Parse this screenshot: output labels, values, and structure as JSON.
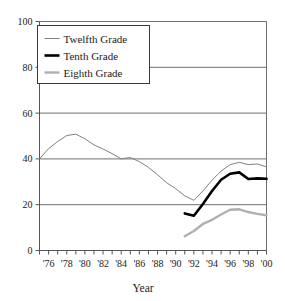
{
  "chart_data": {
    "type": "line",
    "title": "",
    "xlabel": "Year",
    "ylabel": "",
    "xlim": [
      1975,
      2000
    ],
    "ylim": [
      0,
      100
    ],
    "yticks": [
      0,
      20,
      40,
      60,
      80,
      100
    ],
    "ytick_labels": [
      "0",
      "20",
      "40",
      "60",
      "80",
      "100"
    ],
    "xticks": [
      1975,
      1976,
      1977,
      1978,
      1979,
      1980,
      1981,
      1982,
      1983,
      1984,
      1985,
      1986,
      1987,
      1988,
      1989,
      1990,
      1991,
      1992,
      1993,
      1994,
      1995,
      1996,
      1997,
      1998,
      1999,
      2000
    ],
    "xtick_labels": [
      "'76",
      "'78",
      "'80",
      "'82",
      "'84",
      "'86",
      "'88",
      "'90",
      "'92",
      "'94",
      "'96",
      "'98",
      "'00"
    ],
    "xtick_label_years": [
      1976,
      1978,
      1980,
      1982,
      1984,
      1986,
      1988,
      1990,
      1992,
      1994,
      1996,
      1998,
      2000
    ],
    "grid": "horizontal",
    "legend_position": "upper-left",
    "series": [
      {
        "name": "Twelfth Grade",
        "color": "#808080",
        "width": 1,
        "x": [
          1975,
          1976,
          1977,
          1978,
          1979,
          1980,
          1981,
          1982,
          1983,
          1984,
          1985,
          1986,
          1987,
          1988,
          1989,
          1990,
          1991,
          1992,
          1993,
          1994,
          1995,
          1996,
          1997,
          1998,
          1999,
          2000
        ],
        "values": [
          40.0,
          44.5,
          47.6,
          50.2,
          50.8,
          48.8,
          46.1,
          44.3,
          42.3,
          40.0,
          40.6,
          38.8,
          36.3,
          33.1,
          29.6,
          27.0,
          23.9,
          21.9,
          26.0,
          30.7,
          34.7,
          37.5,
          38.5,
          37.5,
          37.8,
          36.5
        ],
        "legend_sample": "thin-gray-line"
      },
      {
        "name": "Tenth Grade",
        "color": "#000000",
        "width": 2.6,
        "x": [
          1991,
          1992,
          1993,
          1994,
          1995,
          1996,
          1997,
          1998,
          1999,
          2000
        ],
        "values": [
          16.2,
          15.2,
          20.3,
          26.0,
          30.9,
          33.5,
          34.1,
          31.2,
          31.5,
          31.3
        ],
        "legend_sample": "thick-black-line"
      },
      {
        "name": "Eighth Grade",
        "color": "#b0b0b0",
        "width": 2.4,
        "x": [
          1991,
          1992,
          1993,
          1994,
          1995,
          1996,
          1997,
          1998,
          1999,
          2000
        ],
        "values": [
          6.2,
          8.5,
          11.6,
          13.4,
          15.7,
          17.8,
          18.0,
          16.8,
          16.0,
          15.4
        ],
        "legend_sample": "thick-lightgray-line"
      }
    ]
  },
  "legend": {
    "items": [
      {
        "label": "Twelfth Grade"
      },
      {
        "label": "Tenth Grade"
      },
      {
        "label": "Eighth Grade"
      }
    ]
  },
  "axes": {
    "x_title": "Year"
  },
  "colors": {
    "frame": "#555555",
    "grid": "#6e6e6e",
    "text": "#1a1a1a",
    "twelfth": "#808080",
    "tenth": "#000000",
    "eighth": "#b0b0b0"
  }
}
